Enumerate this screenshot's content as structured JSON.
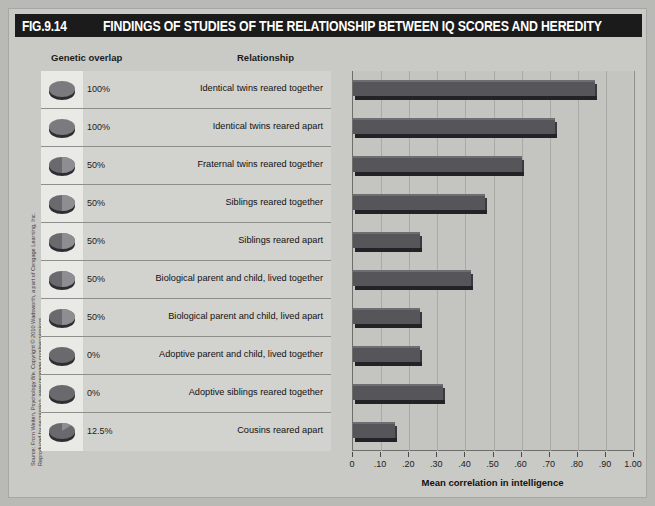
{
  "figure": {
    "number": "FIG.9.14",
    "title": "FINDINGS OF STUDIES OF THE RELATIONSHIP BETWEEN IQ SCORES AND HEREDITY",
    "credit_line1": "Source: From Weiten, Psychology 8/e. Copyright © 2010 Wadsworth, a part of Cengage Learning, Inc.",
    "credit_line2": "Reproduced by permission. www.cengage.com/permissions"
  },
  "columns": {
    "genetic_overlap": "Genetic overlap",
    "relationship": "Relationship"
  },
  "colors": {
    "bar_fill": "#55555a",
    "bar_top": "#6e6e72",
    "bar_shadow": "#232327",
    "panel_bg": "#d2d2cf",
    "plot_bg": "#c4c4c1",
    "title_bar": "#1b1b1b"
  },
  "chart_data": {
    "type": "bar",
    "title": "FINDINGS OF STUDIES OF THE RELATIONSHIP BETWEEN IQ SCORES AND HEREDITY",
    "orientation": "horizontal",
    "xlabel": "Mean correlation in intelligence",
    "ylabel": "",
    "xlim": [
      0,
      1.0
    ],
    "grid": true,
    "legend": "none",
    "tick_labels": [
      "0",
      ".10",
      ".20",
      ".30",
      ".40",
      ".50",
      ".60",
      ".70",
      ".80",
      ".90",
      "1.00"
    ],
    "tick_values": [
      0,
      0.1,
      0.2,
      0.3,
      0.4,
      0.5,
      0.6,
      0.7,
      0.8,
      0.9,
      1.0
    ],
    "categories": [
      "Identical twins reared together",
      "Identical twins reared apart",
      "Fraternal twins reared together",
      "Siblings reared together",
      "Siblings reared apart",
      "Biological parent and child, lived together",
      "Biological parent and child, lived apart",
      "Adoptive parent and child, lived together",
      "Adoptive siblings reared together",
      "Cousins reared apart"
    ],
    "values": [
      0.86,
      0.72,
      0.6,
      0.47,
      0.24,
      0.42,
      0.24,
      0.24,
      0.32,
      0.15
    ],
    "genetic_overlap": [
      "100%",
      "100%",
      "50%",
      "50%",
      "50%",
      "50%",
      "50%",
      "0%",
      "0%",
      "12.5%"
    ],
    "overlap_fraction": [
      1.0,
      1.0,
      0.5,
      0.5,
      0.5,
      0.5,
      0.5,
      0.0,
      0.0,
      0.125
    ]
  }
}
